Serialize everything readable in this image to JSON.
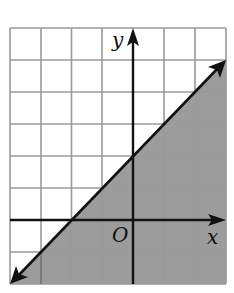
{
  "diagram": {
    "type": "coordinate-grid-inequality",
    "grid": {
      "x_min": -4,
      "x_max": 3,
      "y_min": -2,
      "y_max": 6,
      "cell_px": 31.5
    },
    "axes": {
      "x_label": "x",
      "y_label": "y",
      "origin_label": "O"
    },
    "boundary_line": {
      "equation": "y = x + 2",
      "style": "solid",
      "from": [
        -4,
        -2
      ],
      "to": [
        3,
        5
      ]
    },
    "shaded_region": "below line (y < x + 2 or y <= x + 2)",
    "colors": {
      "shade": "#9c9c9c",
      "grid": "#9a9a9a",
      "axis": "#111111",
      "background": "#ffffff"
    }
  }
}
